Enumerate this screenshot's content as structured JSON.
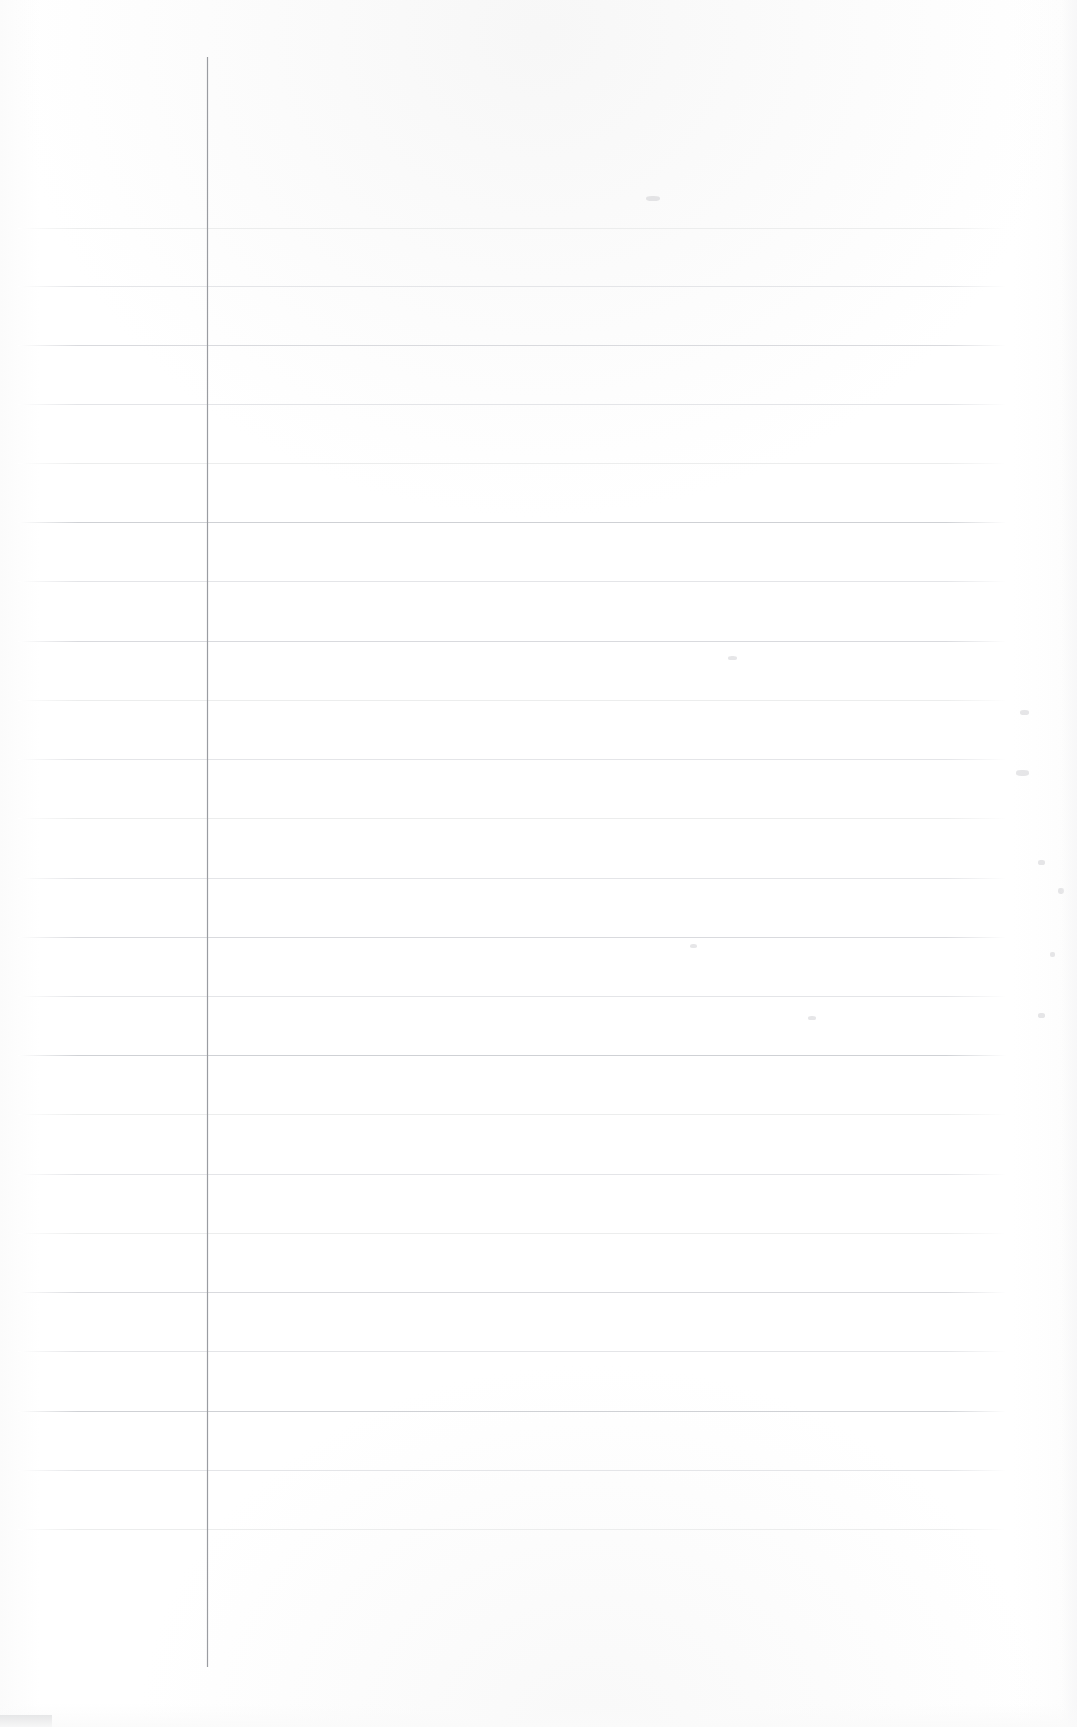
{
  "document": {
    "kind": "scanned-blank-ruled-page",
    "title": "",
    "visible_text": "",
    "page_width": 1077,
    "page_height": 1727,
    "background_color": "#ffffff"
  },
  "paper": {
    "surface_color": "#ffffff",
    "edge_tint_color": "#fbfbfb"
  },
  "margin_rule": {
    "name": "vertical-margin-line",
    "color": "#9a9ca1",
    "x": 207,
    "top": 57,
    "bottom": 1667,
    "thickness": 1
  },
  "ruled_lines": {
    "color_default": "#d9dade",
    "color_faint": "#e4e5e8",
    "color_fainter": "#eceded",
    "color_dark": "#cfd1d5",
    "left_x": 18,
    "right_x": 1006,
    "count": 22,
    "rows": [
      {
        "y": 228,
        "tone": "fainter"
      },
      {
        "y": 286,
        "tone": "faint"
      },
      {
        "y": 345,
        "tone": "default"
      },
      {
        "y": 404,
        "tone": "faint"
      },
      {
        "y": 463,
        "tone": "fainter"
      },
      {
        "y": 522,
        "tone": "dark"
      },
      {
        "y": 581,
        "tone": "faint"
      },
      {
        "y": 641,
        "tone": "default"
      },
      {
        "y": 700,
        "tone": "fainter"
      },
      {
        "y": 759,
        "tone": "faint"
      },
      {
        "y": 818,
        "tone": "fainter"
      },
      {
        "y": 878,
        "tone": "faint"
      },
      {
        "y": 937,
        "tone": "default"
      },
      {
        "y": 996,
        "tone": "faint"
      },
      {
        "y": 1055,
        "tone": "dark"
      },
      {
        "y": 1114,
        "tone": "fainter"
      },
      {
        "y": 1174,
        "tone": "faint"
      },
      {
        "y": 1233,
        "tone": "fainter"
      },
      {
        "y": 1292,
        "tone": "default"
      },
      {
        "y": 1351,
        "tone": "faint"
      },
      {
        "y": 1411,
        "tone": "dark"
      },
      {
        "y": 1470,
        "tone": "faint"
      },
      {
        "y": 1529,
        "tone": "fainter"
      }
    ]
  },
  "artifacts": {
    "name": "scan-artifacts",
    "smudges": [
      {
        "x": 1020,
        "y": 710,
        "w": 9,
        "h": 5,
        "kind": "tiny"
      },
      {
        "x": 1016,
        "y": 770,
        "w": 13,
        "h": 6,
        "kind": "tiny"
      },
      {
        "x": 1038,
        "y": 860,
        "w": 7,
        "h": 5,
        "kind": "tiny"
      },
      {
        "x": 1058,
        "y": 888,
        "w": 6,
        "h": 6,
        "kind": "tiny"
      },
      {
        "x": 1050,
        "y": 952,
        "w": 5,
        "h": 5,
        "kind": "tiny"
      },
      {
        "x": 1038,
        "y": 1013,
        "w": 7,
        "h": 5,
        "kind": "tiny"
      },
      {
        "x": 728,
        "y": 656,
        "w": 9,
        "h": 4,
        "kind": "tiny"
      },
      {
        "x": 690,
        "y": 944,
        "w": 7,
        "h": 4,
        "kind": "tiny"
      },
      {
        "x": 808,
        "y": 1016,
        "w": 8,
        "h": 4,
        "kind": "tiny"
      },
      {
        "x": 646,
        "y": 196,
        "w": 14,
        "h": 5,
        "kind": "tiny"
      }
    ],
    "corner_bar": {
      "name": "bottom-left-gray-bar",
      "x": 0,
      "y": 1715,
      "width": 52,
      "height": 12,
      "color": "#d5d6d8"
    }
  }
}
